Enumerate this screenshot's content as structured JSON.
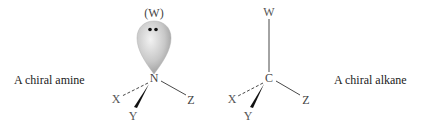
{
  "left_molecule": {
    "caption": "A chiral amine",
    "center_atom": "N",
    "lone_pair_label": "(W)",
    "substituents": {
      "x": "X",
      "y": "Y",
      "z": "Z"
    }
  },
  "right_molecule": {
    "caption": "A chiral alkane",
    "center_atom": "C",
    "substituents": {
      "w": "W",
      "x": "X",
      "y": "Y",
      "z": "Z"
    }
  },
  "colors": {
    "text": "#222222",
    "atom_label": "#444444",
    "bond": "#333333",
    "orbital_light": "#eeeeee",
    "orbital_dark": "#9a9a9a"
  }
}
